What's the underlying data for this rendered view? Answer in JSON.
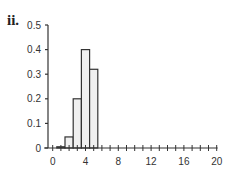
{
  "panel_label": "ii.",
  "chart_data": {
    "type": "bar",
    "title": "",
    "xlabel": "",
    "ylabel": "",
    "x": [
      0,
      1,
      2,
      3,
      4,
      5,
      6,
      7,
      8,
      9,
      10,
      11,
      12,
      13,
      14,
      15,
      16,
      17,
      18,
      19,
      20
    ],
    "values": [
      0,
      0.005,
      0.045,
      0.2,
      0.4,
      0.32,
      0,
      0,
      0,
      0,
      0,
      0,
      0,
      0,
      0,
      0,
      0,
      0,
      0,
      0,
      0
    ],
    "xlim": [
      0,
      20
    ],
    "ylim": [
      0,
      0.5
    ],
    "xticks": [
      0,
      4,
      8,
      12,
      16,
      20
    ],
    "yticks": [
      0,
      0.1,
      0.2,
      0.3,
      0.4,
      0.5
    ],
    "ytick_labels": [
      "0",
      "0.1",
      "0.2",
      "0.3",
      "0.4",
      "0.5"
    ],
    "grid": false,
    "bar_color": "#f0f0f0",
    "edge_color": "#333333"
  }
}
